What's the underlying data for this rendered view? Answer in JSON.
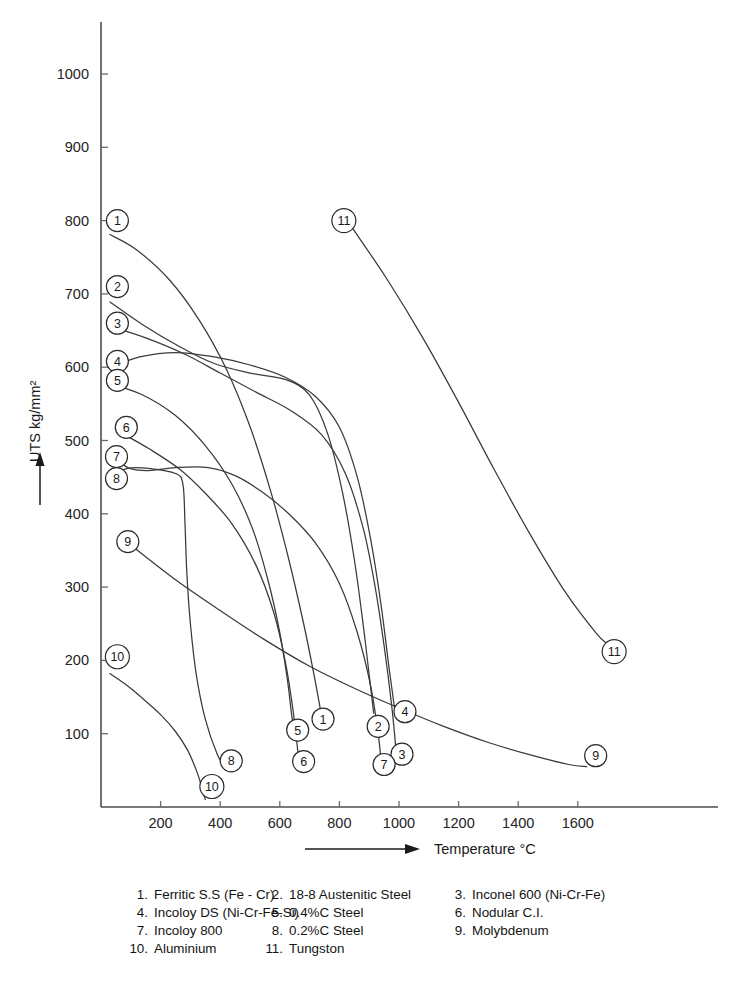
{
  "chart_data": {
    "type": "line",
    "title": "",
    "xlabel": "Temperature °C",
    "ylabel": "UTS kg/mm²",
    "xlim": [
      0,
      1750
    ],
    "ylim": [
      0,
      1070
    ],
    "xticks": [
      200,
      400,
      600,
      800,
      1000,
      1200,
      1400,
      1600
    ],
    "xtick_labels": [
      "200",
      "400",
      "600",
      "800",
      "1000",
      "1200",
      "1400",
      "1600"
    ],
    "yticks": [
      100,
      200,
      300,
      400,
      500,
      600,
      700,
      800,
      900,
      1000
    ],
    "ytick_labels": [
      "100",
      "200",
      "300",
      "400",
      "500",
      "600",
      "700",
      "800",
      "900",
      "1000"
    ],
    "grid": false,
    "legend_position": "below-axes",
    "series": [
      {
        "id": 1,
        "name": "Ferritic S.S (Fe - Cr)",
        "label": "1",
        "points": [
          [
            30,
            781
          ],
          [
            120,
            760
          ],
          [
            230,
            719
          ],
          [
            330,
            664
          ],
          [
            420,
            598
          ],
          [
            500,
            519
          ],
          [
            570,
            430
          ],
          [
            630,
            338
          ],
          [
            680,
            250
          ],
          [
            715,
            180
          ],
          [
            735,
            136
          ]
        ],
        "start_callout": {
          "label": "1",
          "x": 55,
          "y": 800
        },
        "end_callout": {
          "label": "1",
          "x": 745,
          "y": 120
        }
      },
      {
        "id": 2,
        "name": "18-8 Austenitic Steel",
        "label": "2",
        "points": [
          [
            30,
            689
          ],
          [
            140,
            658
          ],
          [
            260,
            629
          ],
          [
            380,
            605
          ],
          [
            500,
            592
          ],
          [
            620,
            583
          ],
          [
            700,
            562
          ],
          [
            760,
            510
          ],
          [
            810,
            430
          ],
          [
            850,
            338
          ],
          [
            880,
            248
          ],
          [
            900,
            180
          ],
          [
            915,
            128
          ]
        ],
        "start_callout": {
          "label": "2",
          "x": 55,
          "y": 710
        },
        "end_callout": {
          "label": "2",
          "x": 930,
          "y": 110
        }
      },
      {
        "id": 3,
        "name": "Inconel 600 (Ni-Cr-Fe)",
        "label": "3",
        "points": [
          [
            35,
            655
          ],
          [
            150,
            640
          ],
          [
            280,
            618
          ],
          [
            400,
            592
          ],
          [
            520,
            566
          ],
          [
            640,
            540
          ],
          [
            740,
            508
          ],
          [
            820,
            455
          ],
          [
            880,
            380
          ],
          [
            920,
            300
          ],
          [
            950,
            220
          ],
          [
            975,
            140
          ],
          [
            990,
            78
          ]
        ],
        "start_callout": {
          "label": "3",
          "x": 55,
          "y": 660
        },
        "end_callout": {
          "label": "3",
          "x": 1010,
          "y": 72
        }
      },
      {
        "id": 4,
        "name": "Incoloy DS (Ni-Cr-Fe-Si)",
        "label": "4",
        "points": [
          [
            35,
            600
          ],
          [
            130,
            614
          ],
          [
            250,
            620
          ],
          [
            380,
            614
          ],
          [
            500,
            603
          ],
          [
            620,
            586
          ],
          [
            720,
            560
          ],
          [
            800,
            518
          ],
          [
            860,
            450
          ],
          [
            905,
            365
          ],
          [
            940,
            275
          ],
          [
            965,
            195
          ],
          [
            985,
            135
          ]
        ],
        "start_callout": {
          "label": "4",
          "x": 55,
          "y": 608
        },
        "end_callout": {
          "label": "4",
          "x": 1020,
          "y": 130
        }
      },
      {
        "id": 5,
        "name": "0.4%C Steel",
        "label": "5",
        "points": [
          [
            35,
            577
          ],
          [
            140,
            562
          ],
          [
            250,
            534
          ],
          [
            350,
            493
          ],
          [
            440,
            440
          ],
          [
            510,
            378
          ],
          [
            560,
            310
          ],
          [
            600,
            238
          ],
          [
            625,
            175
          ],
          [
            640,
            125
          ],
          [
            650,
            100
          ]
        ],
        "start_callout": {
          "label": "5",
          "x": 55,
          "y": 582
        },
        "end_callout": {
          "label": "5",
          "x": 660,
          "y": 105
        }
      },
      {
        "id": 6,
        "name": "Nodular C.I.",
        "label": "6",
        "points": [
          [
            70,
            510
          ],
          [
            160,
            489
          ],
          [
            260,
            462
          ],
          [
            350,
            428
          ],
          [
            440,
            386
          ],
          [
            520,
            330
          ],
          [
            580,
            265
          ],
          [
            620,
            195
          ],
          [
            645,
            130
          ],
          [
            660,
            78
          ],
          [
            665,
            60
          ]
        ],
        "start_callout": {
          "label": "6",
          "x": 85,
          "y": 518
        },
        "end_callout": {
          "label": "6",
          "x": 680,
          "y": 62
        }
      },
      {
        "id": 7,
        "name": "Incoloy 800",
        "label": "7",
        "points": [
          [
            30,
            484
          ],
          [
            90,
            463
          ],
          [
            160,
            459
          ],
          [
            250,
            463
          ],
          [
            360,
            463
          ],
          [
            450,
            452
          ],
          [
            540,
            430
          ],
          [
            630,
            400
          ],
          [
            720,
            360
          ],
          [
            800,
            305
          ],
          [
            860,
            238
          ],
          [
            905,
            165
          ],
          [
            930,
            100
          ],
          [
            940,
            62
          ]
        ],
        "start_callout": {
          "label": "7",
          "x": 52,
          "y": 478
        },
        "end_callout": {
          "label": "7",
          "x": 950,
          "y": 58
        }
      },
      {
        "id": 8,
        "name": "0.2%C Steel",
        "label": "8",
        "points": [
          [
            30,
            450
          ],
          [
            90,
            462
          ],
          [
            160,
            462
          ],
          [
            250,
            455
          ],
          [
            275,
            440
          ],
          [
            282,
            385
          ],
          [
            288,
            320
          ],
          [
            300,
            250
          ],
          [
            320,
            180
          ],
          [
            350,
            120
          ],
          [
            390,
            72
          ],
          [
            420,
            52
          ]
        ],
        "start_callout": {
          "label": "8",
          "x": 52,
          "y": 448
        },
        "end_callout": {
          "label": "8",
          "x": 437,
          "y": 63
        }
      },
      {
        "id": 9,
        "name": "Molybdenum",
        "label": "9",
        "points": [
          [
            110,
            354
          ],
          [
            250,
            310
          ],
          [
            400,
            268
          ],
          [
            550,
            228
          ],
          [
            700,
            192
          ],
          [
            850,
            162
          ],
          [
            1000,
            135
          ],
          [
            1150,
            110
          ],
          [
            1300,
            88
          ],
          [
            1450,
            70
          ],
          [
            1570,
            58
          ],
          [
            1630,
            55
          ]
        ],
        "start_callout": {
          "label": "9",
          "x": 90,
          "y": 362
        },
        "end_callout": {
          "label": "9",
          "x": 1660,
          "y": 70
        }
      },
      {
        "id": 10,
        "name": "Aluminium",
        "label": "10",
        "points": [
          [
            30,
            182
          ],
          [
            80,
            168
          ],
          [
            140,
            148
          ],
          [
            200,
            126
          ],
          [
            250,
            103
          ],
          [
            290,
            78
          ],
          [
            320,
            50
          ],
          [
            340,
            25
          ],
          [
            350,
            10
          ]
        ],
        "start_callout": {
          "label": "10",
          "x": 55,
          "y": 205
        },
        "end_callout": {
          "label": "10",
          "x": 372,
          "y": 28
        }
      },
      {
        "id": 11,
        "name": "Tungston",
        "label": "11",
        "points": [
          [
            840,
            792
          ],
          [
            960,
            720
          ],
          [
            1080,
            640
          ],
          [
            1200,
            552
          ],
          [
            1320,
            460
          ],
          [
            1440,
            372
          ],
          [
            1560,
            292
          ],
          [
            1660,
            238
          ],
          [
            1700,
            222
          ]
        ],
        "start_callout": {
          "label": "11",
          "x": 815,
          "y": 800
        },
        "end_callout": {
          "label": "11",
          "x": 1722,
          "y": 212
        }
      }
    ]
  },
  "axes": {
    "y_label": "UTS kg/mm²",
    "x_label": "Temperature °C"
  },
  "legend": {
    "entries": [
      {
        "num": "1.",
        "name": "Ferritic S.S (Fe - Cr)"
      },
      {
        "num": "2.",
        "name": "18-8 Austenitic Steel"
      },
      {
        "num": "3.",
        "name": "Inconel 600 (Ni-Cr-Fe)"
      },
      {
        "num": "4.",
        "name": "Incoloy DS (Ni-Cr-Fe-Si)"
      },
      {
        "num": "5.",
        "name": "0.4%C Steel"
      },
      {
        "num": "6.",
        "name": "Nodular C.I."
      },
      {
        "num": "7.",
        "name": "Incoloy 800"
      },
      {
        "num": "8.",
        "name": "0.2%C Steel"
      },
      {
        "num": "9.",
        "name": "Molybdenum"
      },
      {
        "num": "10.",
        "name": "Aluminium"
      },
      {
        "num": "11.",
        "name": "Tungston"
      }
    ]
  },
  "colors": {
    "curve": "#3a3a3a",
    "axis": "#4d4d4d",
    "text": "#1a1a1a",
    "background": "#ffffff"
  }
}
